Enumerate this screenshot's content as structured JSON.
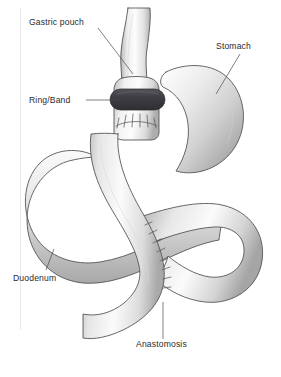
{
  "figure": {
    "canvas": {
      "width": 281,
      "height": 377,
      "background": "#ffffff"
    }
  },
  "labels": [
    {
      "key": "gastric-pouch",
      "text": "Gastric pouch",
      "x": 29,
      "y": 25,
      "anchor": "start",
      "leader": "M 98 28 L 133 74"
    },
    {
      "key": "stomach",
      "text": "Stomach",
      "x": 216,
      "y": 49,
      "anchor": "start",
      "leader": "M 240 54 L 216 94"
    },
    {
      "key": "ring-band",
      "text": "Ring/Band",
      "x": 29,
      "y": 103,
      "anchor": "start",
      "leader": "M 86 100 L 120 100"
    },
    {
      "key": "duodenum",
      "text": "Duodenum",
      "x": 13,
      "y": 281,
      "anchor": "start",
      "leader": "M 46 270 L 54 249"
    },
    {
      "key": "anastomosis",
      "text": "Anastomosis",
      "x": 136,
      "y": 347,
      "anchor": "start",
      "leader": "M 163 339 L 163 302"
    }
  ],
  "parts": [
    {
      "key": "esophagus",
      "name": "esophagus-tube"
    },
    {
      "key": "gastric-pouch",
      "name": "gastric-pouch-body"
    },
    {
      "key": "band",
      "name": "restrictive-ring-band",
      "color": "#3d3d42"
    },
    {
      "key": "pouch-stitches",
      "name": "pouch-anastomosis-stitches"
    },
    {
      "key": "stomach-remnant",
      "name": "stomach-remnant"
    },
    {
      "key": "duodenum-loop",
      "name": "duodenum-loop"
    },
    {
      "key": "right-loop",
      "name": "jejunal-right-loop"
    },
    {
      "key": "roux-limb",
      "name": "roux-limb"
    },
    {
      "key": "anastomosis-stitches",
      "name": "jejunojejunal-stitches"
    }
  ],
  "colors": {
    "outline": "#4d4d4d",
    "band": "#3d3d42",
    "tissue_light": "#fbfbfb",
    "tissue_mid": "#d8d8d8",
    "tissue_dark": "#a6a6a6",
    "label_text": "#2b2b2b",
    "leader_line": "#4a4a4a",
    "background": "#ffffff"
  }
}
